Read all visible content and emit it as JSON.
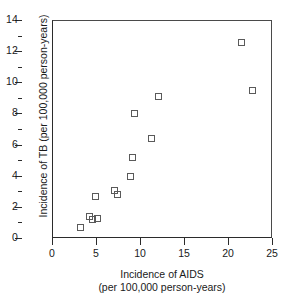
{
  "chart_data": {
    "type": "scatter",
    "title": "",
    "xlabel": "Incidence of AIDS",
    "xlabel_sub": "(per 100,000 person-years)",
    "ylabel": "Incidence of TB (per 100,000 person-years)",
    "xlim": [
      0,
      25
    ],
    "ylim": [
      0,
      14
    ],
    "xticks": [
      0,
      5,
      10,
      15,
      20,
      25
    ],
    "yticks": [
      0,
      2,
      4,
      6,
      8,
      10,
      12,
      14
    ],
    "y_minor_ticks": [
      1,
      3,
      5,
      7,
      9,
      11,
      13
    ],
    "grid": false,
    "legend": "none",
    "marker": "open-square",
    "marker_color": "#5a5a5a",
    "axis_color": "#2b2b2b",
    "points": [
      {
        "x": 3.3,
        "y": 0.6
      },
      {
        "x": 4.4,
        "y": 1.3
      },
      {
        "x": 4.7,
        "y": 1.1
      },
      {
        "x": 5.3,
        "y": 1.2
      },
      {
        "x": 5.0,
        "y": 2.6
      },
      {
        "x": 7.2,
        "y": 3.0
      },
      {
        "x": 7.6,
        "y": 2.7
      },
      {
        "x": 9.0,
        "y": 3.9
      },
      {
        "x": 9.3,
        "y": 5.1
      },
      {
        "x": 9.5,
        "y": 7.9
      },
      {
        "x": 11.4,
        "y": 6.3
      },
      {
        "x": 12.2,
        "y": 9.0
      },
      {
        "x": 21.7,
        "y": 12.5
      },
      {
        "x": 22.9,
        "y": 9.4
      }
    ]
  }
}
